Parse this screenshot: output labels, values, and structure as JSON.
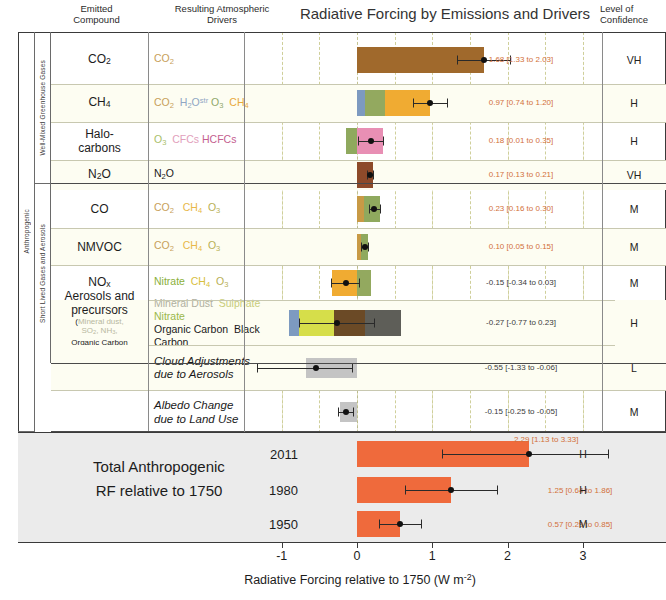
{
  "header": {
    "emitted_compound": "Emitted\nCompound",
    "emitted_compound_l1": "Emitted",
    "emitted_compound_l2": "Compound",
    "drivers_l1": "Resulting Atmospheric",
    "drivers_l2": "Drivers",
    "title": "Radiative Forcing by Emissions and Drivers",
    "confidence_l1": "Level of",
    "confidence_l2": "Confidence"
  },
  "groups": {
    "anthropogenic": "Anthropogenic",
    "natural": "Natural",
    "wmgg": "Well-Mixed Greenhouse Gases",
    "slga": "Short Lived Gases and Aerosols"
  },
  "axis": {
    "ticks": [
      "-1",
      "0",
      "1",
      "2",
      "3"
    ],
    "tick_values": [
      -1,
      0,
      1,
      2,
      3
    ],
    "title": "Radiative Forcing relative to 1750 (W m",
    "title_sup": "-2",
    "title_end": ")"
  },
  "total": {
    "label_l1": "Total Anthropogenic",
    "label_l2": "RF relative to 1750",
    "rows": [
      {
        "year": "2011",
        "value_text": "2.29 [1.13 to 3.33]",
        "confidence": "H",
        "value": 2.29,
        "low": 1.13,
        "high": 3.33
      },
      {
        "year": "1980",
        "value_text": "1.25 [0.64 to 1.86]",
        "confidence": "H",
        "value": 1.25,
        "low": 0.64,
        "high": 1.86
      },
      {
        "year": "1950",
        "value_text": "0.57 [0.29 to 0.85]",
        "confidence": "M",
        "value": 0.57,
        "low": 0.29,
        "high": 0.85
      }
    ]
  },
  "chart_data": {
    "type": "bar",
    "title": "Radiative Forcing by Emissions and Drivers",
    "xlabel": "Radiative Forcing relative to 1750 (W m-2)",
    "ylabel": "",
    "xlim": [
      -1.45,
      3.45
    ],
    "grid": true,
    "legend": "none",
    "orientation": "horizontal",
    "rows": [
      {
        "compound": "CO2",
        "compound_html": "CO<sub>2</sub>",
        "drivers_html": "<span style=\"color:#c8a05a\">CO<sub>2</sub></span>",
        "value_text": "1.68 [1.33 to 2.03]",
        "value": 1.68,
        "low": 1.33,
        "high": 2.03,
        "confidence": "VH",
        "tint": false,
        "segments": [
          {
            "from": 0,
            "to": 1.68,
            "color": "#a0692c"
          }
        ]
      },
      {
        "compound": "CH4",
        "compound_html": "CH<sub>4</sub>",
        "drivers_html": "<span style=\"color:#c8a05a\">CO<sub>2</sub></span>&nbsp; <span style=\"color:#8fa6c4\">H<sub>2</sub>O<sup>str</sup></span> <span style=\"color:#8fa86a\">O<sub>3</sub></span>&nbsp; <span style=\"color:#e8a93c\">CH<sub>4</sub></span>",
        "value_text": "0.97 [0.74 to 1.20]",
        "value": 0.97,
        "low": 0.74,
        "high": 1.2,
        "confidence": "H",
        "tint": true,
        "segments": [
          {
            "from": 0,
            "to": 0.1,
            "color": "#7d9ac0"
          },
          {
            "from": 0.1,
            "to": 0.37,
            "color": "#93a95f"
          },
          {
            "from": 0.37,
            "to": 0.97,
            "color": "#f0ab32"
          }
        ]
      },
      {
        "compound": "Halo-carbons",
        "compound_html": "Halo-<br>carbons",
        "drivers_html": "<span style=\"color:#a9c06a\">O<sub>3</sub></span>&nbsp; <span style=\"color:#e2a0bc\">CFCs</span> <span style=\"color:#c46090\">HCFCs</span>",
        "value_text": "0.18 [0.01 to 0.35]",
        "value": 0.18,
        "low": 0.01,
        "high": 0.35,
        "confidence": "H",
        "tint": false,
        "segments": [
          {
            "from": -0.15,
            "to": 0.0,
            "color": "#8fa95e"
          },
          {
            "from": 0.0,
            "to": 0.35,
            "color": "#e88fb4"
          }
        ]
      },
      {
        "compound": "N2O",
        "compound_html": "N<sub>2</sub>O",
        "drivers_html": "N<sub>2</sub>O",
        "value_text": "0.17 [0.13 to 0.21]",
        "value": 0.17,
        "low": 0.13,
        "high": 0.21,
        "confidence": "VH",
        "tint": true,
        "segments": [
          {
            "from": 0,
            "to": 0.21,
            "color": "#8d4a2a"
          }
        ]
      },
      {
        "compound": "CO",
        "compound_html": "CO",
        "drivers_html": "<span style=\"color:#c8a05a\">CO<sub>2</sub></span>&nbsp;&nbsp; <span style=\"color:#e8b84a\">CH<sub>4</sub></span>&nbsp; <span style=\"color:#b8b056\">O<sub>3</sub></span>",
        "value_text": "0.23 [0.16 to 0.30]",
        "value": 0.23,
        "low": 0.16,
        "high": 0.3,
        "confidence": "M",
        "tint": false,
        "segments": [
          {
            "from": 0,
            "to": 0.09,
            "color": "#c89a46"
          },
          {
            "from": 0.09,
            "to": 0.3,
            "color": "#8fa95e"
          }
        ]
      },
      {
        "compound": "NMVOC",
        "compound_html": "NMVOC",
        "drivers_html": "<span style=\"color:#c8a05a\">CO<sub>2</sub></span>&nbsp;&nbsp; <span style=\"color:#e8b84a\">CH<sub>4</sub></span>&nbsp; <span style=\"color:#b8b056\">O<sub>3</sub></span>",
        "value_text": "0.10 [0.05 to 0.15]",
        "value": 0.1,
        "low": 0.05,
        "high": 0.15,
        "confidence": "M",
        "tint": true,
        "segments": [
          {
            "from": 0,
            "to": 0.05,
            "color": "#c89a46"
          },
          {
            "from": 0.05,
            "to": 0.15,
            "color": "#8fa95e"
          }
        ]
      },
      {
        "compound": "NOx",
        "compound_html": "NO<sub>x</sub>",
        "drivers_html": "<span style=\"color:#8ab03a\">Nitrate</span>&nbsp; <span style=\"color:#d8c040\">CH<sub>4</sub></span>&nbsp; <span style=\"color:#b8b056\">O<sub>3</sub></span>",
        "value_text": "-0.15 [-0.34 to 0.03]",
        "value": -0.15,
        "low": -0.34,
        "high": 0.03,
        "confidence": "M",
        "tint": false,
        "segments": [
          {
            "from": -0.33,
            "to": 0.0,
            "color": "#f0ab32"
          },
          {
            "from": 0.0,
            "to": 0.18,
            "color": "#93a95f"
          }
        ]
      },
      {
        "compound": "Aerosols and precursors",
        "compound_html": "Aerosols and<br>precursors",
        "compound_sub_html": "(<span style=\"color:#b8b8a0\">Mineral dust,</span><br><span style=\"color:#b8b8a0\">SO<sub>2</sub>, NH<sub>3</sub>,</span><br>Organic Carbon<br>and <span style=\"color:#9a9a9a\">Black Carbon)</span>",
        "drivers_html": "<span style=\"color:#b0b0a0\">Mineral Dust</span>&nbsp; <span style=\"color:#c8cc7a\">Sulphate</span> <span style=\"color:#9ab84a\">Nitrate</span><br>Organic Carbon&nbsp; Black Carbon",
        "value_text": "-0.27 [-0.77 to 0.23]",
        "value": -0.27,
        "low": -0.77,
        "high": 0.23,
        "confidence": "H",
        "tint": true,
        "segments": [
          {
            "from": -0.9,
            "to": -0.77,
            "color": "#7d9ac0"
          },
          {
            "from": -0.77,
            "to": -0.3,
            "color": "#d6de4a"
          },
          {
            "from": -0.3,
            "to": 0.1,
            "color": "#6b4a26"
          },
          {
            "from": 0.1,
            "to": 0.58,
            "color": "#5e5e58"
          }
        ]
      },
      {
        "compound": "",
        "compound_html": "",
        "drivers_html": "<i>Cloud Adjustments<br>due to Aerosols</i>",
        "value_text": "-0.55 [-1.33 to -0.06]",
        "value": -0.55,
        "low": -1.33,
        "high": -0.06,
        "confidence": "L",
        "tint": true,
        "segments": [
          {
            "from": -0.68,
            "to": 0.0,
            "color": "#c4c4c4"
          }
        ]
      },
      {
        "compound": "",
        "compound_html": "",
        "drivers_html": "<i>Albedo Change<br>due to Land Use</i>",
        "value_text": "-0.15 [-0.25 to -0.05]",
        "value": -0.15,
        "low": -0.25,
        "high": -0.05,
        "confidence": "M",
        "tint": false,
        "segments": [
          {
            "from": -0.22,
            "to": 0.0,
            "color": "#c4c4c4"
          }
        ]
      },
      {
        "compound": "",
        "compound_html": "",
        "drivers_html": "<i>Changes in<br>Solar Irradiance</i>",
        "value_text": "0.05 [0.00 to 0.10]",
        "value": 0.05,
        "low": 0.0,
        "high": 0.1,
        "confidence": "M",
        "tint": true,
        "segments": [
          {
            "from": 0,
            "to": 0.09,
            "color": "#e8a93c"
          }
        ]
      }
    ],
    "total_series": {
      "color": "#ef6a3c",
      "categories": [
        "2011",
        "1980",
        "1950"
      ],
      "values": [
        2.29,
        1.25,
        0.57
      ],
      "low": [
        1.13,
        0.64,
        0.29
      ],
      "high": [
        3.33,
        1.86,
        0.85
      ],
      "confidence": [
        "H",
        "H",
        "M"
      ]
    }
  }
}
